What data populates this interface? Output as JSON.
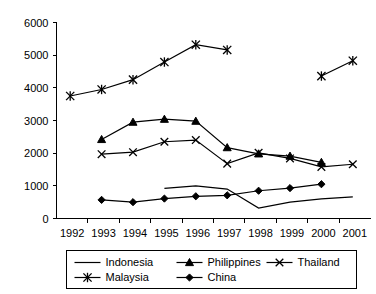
{
  "chart_data": {
    "type": "line",
    "title": "",
    "subtitle": "",
    "xlabel": "",
    "ylabel": "",
    "x": [
      1992,
      1993,
      1994,
      1995,
      1996,
      1997,
      1998,
      1999,
      2000,
      2001
    ],
    "xtick_labels": [
      "1992",
      "1993",
      "1994",
      "1995",
      "1996",
      "1997",
      "1998",
      "1999",
      "2000",
      "2001"
    ],
    "ytick_labels": [
      "0",
      "1000",
      "2000",
      "3000",
      "4000",
      "5000",
      "6000"
    ],
    "yticks": [
      0,
      1000,
      2000,
      3000,
      4000,
      5000,
      6000
    ],
    "ylim": [
      0,
      6000
    ],
    "grid": false,
    "legend_position": "bottom",
    "series": [
      {
        "name": "Indonesia",
        "marker": "none",
        "values": [
          null,
          null,
          null,
          920,
          1000,
          900,
          320,
          500,
          600,
          660
        ]
      },
      {
        "name": "Malaysia",
        "marker": "asterisk",
        "values": [
          3750,
          3950,
          4250,
          4790,
          5320,
          5160,
          null,
          null,
          4360,
          4830
        ]
      },
      {
        "name": "Philippines",
        "marker": "triangle",
        "values": [
          null,
          2420,
          2950,
          3040,
          2980,
          2170,
          1980,
          1910,
          1720,
          null
        ]
      },
      {
        "name": "China",
        "marker": "diamond",
        "values": [
          null,
          570,
          500,
          610,
          680,
          710,
          850,
          930,
          1050,
          null
        ]
      },
      {
        "name": "Thailand",
        "marker": "cross",
        "values": [
          null,
          1970,
          2030,
          2350,
          2400,
          1680,
          2010,
          1840,
          1580,
          1660
        ]
      }
    ]
  },
  "legend": {
    "entries": [
      {
        "label": "Indonesia",
        "marker": "none"
      },
      {
        "label": "Philippines",
        "marker": "triangle"
      },
      {
        "label": "Thailand",
        "marker": "cross"
      },
      {
        "label": "Malaysia",
        "marker": "asterisk"
      },
      {
        "label": "China",
        "marker": "diamond"
      }
    ]
  },
  "colors": {
    "axis": "#000000",
    "series": "#000000",
    "background": "#ffffff"
  }
}
